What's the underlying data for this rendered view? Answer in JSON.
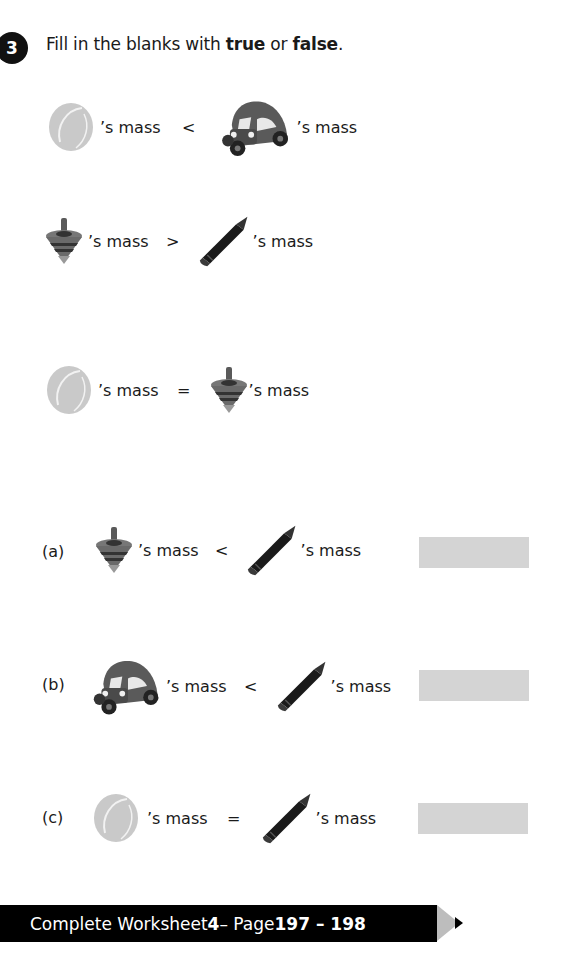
{
  "question": {
    "number": "3",
    "instruction_prefix": "Fill in the blanks with ",
    "word_true": "true",
    "instruction_mid": " or ",
    "word_false": "false",
    "instruction_suffix": "."
  },
  "given_facts": [
    {
      "left_item": "tennis-ball",
      "left_text": "’s mass",
      "symbol": "<",
      "right_item": "toy-car",
      "right_text": "’s mass"
    },
    {
      "left_item": "spinning-top",
      "left_text": "’s mass",
      "symbol": ">",
      "right_item": "crayon",
      "right_text": "’s mass"
    },
    {
      "left_item": "tennis-ball",
      "left_text": "’s mass",
      "symbol": "=",
      "right_item": "spinning-top",
      "right_text": "’s mass"
    }
  ],
  "parts": [
    {
      "label": "(a)",
      "left_item": "spinning-top",
      "left_text": "’s mass",
      "symbol": "<",
      "right_item": "crayon",
      "right_text": "’s mass",
      "answer": ""
    },
    {
      "label": "(b)",
      "left_item": "toy-car",
      "left_text": "’s mass",
      "symbol": "<",
      "right_item": "crayon",
      "right_text": "’s mass",
      "answer": ""
    },
    {
      "label": "(c)",
      "left_item": "tennis-ball",
      "left_text": "’s mass",
      "symbol": "=",
      "right_item": "crayon",
      "right_text": "’s mass",
      "answer": ""
    }
  ],
  "footer": {
    "prefix": "Complete Worksheet ",
    "worksheet_number": "4",
    "middle": " – Page ",
    "pages": "197 – 198"
  },
  "colors": {
    "answer_box": "#d4d4d4",
    "footer_bg": "#000000",
    "footer_tip": "#bdbdbd"
  }
}
